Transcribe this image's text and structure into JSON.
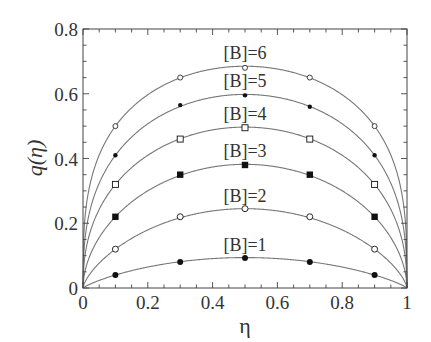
{
  "chart_data": {
    "type": "line",
    "title": "",
    "xlabel": "η",
    "ylabel": "q(η)",
    "xlim": [
      0,
      1
    ],
    "ylim": [
      0,
      0.8
    ],
    "xticks": [
      0,
      0.2,
      0.4,
      0.6,
      0.8,
      1
    ],
    "xtick_labels": [
      "0",
      "0.2",
      "0.4",
      "0.6",
      "0.8",
      "1"
    ],
    "yticks": [
      0,
      0.2,
      0.4,
      0.6,
      0.8
    ],
    "ytick_labels": [
      "0",
      "0.2",
      "0.4",
      "0.6",
      "0.8"
    ],
    "grid": false,
    "legend": "inline labels above each curve",
    "x": [
      0.1,
      0.3,
      0.5,
      0.7,
      0.9
    ],
    "series": [
      {
        "name": "[B]=6",
        "label": "[B]=6",
        "marker": "open-circle-small",
        "peak": 0.685,
        "values": [
          0.5,
          0.65,
          0.68,
          0.65,
          0.5
        ]
      },
      {
        "name": "[B]=5",
        "label": "[B]=5",
        "marker": "filled-dot-small",
        "peak": 0.598,
        "values": [
          0.41,
          0.565,
          0.595,
          0.56,
          0.41
        ]
      },
      {
        "name": "[B]=4",
        "label": "[B]=4",
        "marker": "open-square",
        "peak": 0.497,
        "values": [
          0.32,
          0.46,
          0.495,
          0.46,
          0.32
        ]
      },
      {
        "name": "[B]=3",
        "label": "[B]=3",
        "marker": "filled-square",
        "peak": 0.382,
        "values": [
          0.22,
          0.35,
          0.38,
          0.35,
          0.22
        ]
      },
      {
        "name": "[B]=2",
        "label": "[B]=2",
        "marker": "open-circle",
        "peak": 0.245,
        "values": [
          0.12,
          0.22,
          0.245,
          0.22,
          0.12
        ]
      },
      {
        "name": "[B]=1",
        "label": "[B]=1",
        "marker": "filled-circle",
        "peak": 0.094,
        "values": [
          0.04,
          0.08,
          0.093,
          0.08,
          0.04
        ]
      }
    ]
  },
  "colors": {
    "curve": "#777777",
    "axis": "#444444",
    "marker": "#111111",
    "text": "#333333"
  }
}
